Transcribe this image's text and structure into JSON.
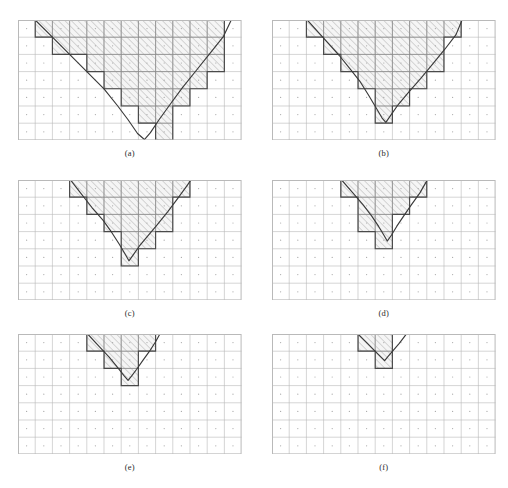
{
  "figure": {
    "caption": "",
    "panel_count": 6,
    "grid": {
      "cols": 13,
      "rows": 7,
      "cell_px": 17.2
    },
    "colors": {
      "grid_line": "#8d8d8d",
      "grid_line_light": "#b9b9b9",
      "outline": "#4a4a4a",
      "curve": "#3a3a3a",
      "hatch": "#9a9a9a",
      "hatch_fill": "#f5f5f5",
      "center_dot": "#9a9a9a",
      "background": "#ffffff"
    },
    "panels": [
      {
        "id": "a",
        "label": "(a)",
        "x": 18,
        "y": 20,
        "cols": 13,
        "rows": 7,
        "cell": 17.2,
        "level": 1,
        "staircase": [
          [
            1,
            0
          ],
          [
            1,
            1
          ],
          [
            2,
            1
          ],
          [
            2,
            2
          ],
          [
            4,
            2
          ],
          [
            4,
            3
          ],
          [
            5,
            3
          ],
          [
            5,
            4
          ],
          [
            6,
            4
          ],
          [
            6,
            5
          ],
          [
            7,
            5
          ],
          [
            7,
            6
          ],
          [
            8,
            6
          ],
          [
            8,
            7
          ],
          [
            9,
            7
          ],
          [
            9,
            5
          ],
          [
            10,
            5
          ],
          [
            10,
            4
          ],
          [
            11,
            4
          ],
          [
            11,
            3
          ],
          [
            12,
            3
          ],
          [
            12,
            0
          ]
        ],
        "curve": [
          [
            1.0,
            0.0
          ],
          [
            2.0,
            1.0
          ],
          [
            3.0,
            2.0
          ],
          [
            4.0,
            3.0
          ],
          [
            5.0,
            4.0
          ],
          [
            5.8,
            5.0
          ],
          [
            6.4,
            5.8
          ],
          [
            6.95,
            6.6
          ],
          [
            7.35,
            6.95
          ],
          [
            7.7,
            6.55
          ],
          [
            8.2,
            5.8
          ],
          [
            8.85,
            4.9
          ],
          [
            9.55,
            3.95
          ],
          [
            10.35,
            2.95
          ],
          [
            11.15,
            1.95
          ],
          [
            11.95,
            0.95
          ],
          [
            12.4,
            0.0
          ]
        ]
      },
      {
        "id": "b",
        "label": "(b)",
        "x": 272,
        "y": 20,
        "cols": 13,
        "rows": 7,
        "cell": 17.2,
        "level": 2,
        "staircase": [
          [
            2,
            0
          ],
          [
            2,
            1
          ],
          [
            3,
            1
          ],
          [
            3,
            2
          ],
          [
            4,
            2
          ],
          [
            4,
            3
          ],
          [
            5,
            3
          ],
          [
            5,
            4
          ],
          [
            6,
            4
          ],
          [
            6,
            5
          ],
          [
            6,
            6
          ],
          [
            7,
            6
          ],
          [
            7,
            5
          ],
          [
            8,
            5
          ],
          [
            8,
            4
          ],
          [
            9,
            4
          ],
          [
            9,
            3
          ],
          [
            10,
            3
          ],
          [
            10,
            2
          ],
          [
            10,
            1
          ],
          [
            11,
            1
          ],
          [
            11,
            0
          ]
        ],
        "curve": [
          [
            2.05,
            0.0
          ],
          [
            3.0,
            1.05
          ],
          [
            3.9,
            2.05
          ],
          [
            4.55,
            2.85
          ],
          [
            5.1,
            3.55
          ],
          [
            5.6,
            4.35
          ],
          [
            6.05,
            5.1
          ],
          [
            6.4,
            5.7
          ],
          [
            6.62,
            5.95
          ],
          [
            6.9,
            5.55
          ],
          [
            7.35,
            4.9
          ],
          [
            7.95,
            4.2
          ],
          [
            8.65,
            3.4
          ],
          [
            9.35,
            2.55
          ],
          [
            10.05,
            1.7
          ],
          [
            10.7,
            0.85
          ],
          [
            11.05,
            0.0
          ]
        ]
      },
      {
        "id": "c",
        "label": "(c)",
        "x": 18,
        "y": 180,
        "cols": 13,
        "rows": 7,
        "cell": 17.2,
        "level": 3,
        "staircase": [
          [
            3,
            0
          ],
          [
            3,
            1
          ],
          [
            4,
            1
          ],
          [
            4,
            2
          ],
          [
            5,
            2
          ],
          [
            5,
            3
          ],
          [
            6,
            3
          ],
          [
            6,
            4
          ],
          [
            6,
            5
          ],
          [
            7,
            5
          ],
          [
            7,
            4
          ],
          [
            8,
            4
          ],
          [
            8,
            3
          ],
          [
            9,
            3
          ],
          [
            9,
            2
          ],
          [
            9,
            1
          ],
          [
            10,
            1
          ],
          [
            10,
            0
          ]
        ],
        "curve": [
          [
            2.9,
            -0.2
          ],
          [
            3.6,
            0.7
          ],
          [
            4.3,
            1.6
          ],
          [
            4.95,
            2.35
          ],
          [
            5.45,
            3.05
          ],
          [
            5.9,
            3.75
          ],
          [
            6.25,
            4.35
          ],
          [
            6.45,
            4.7
          ],
          [
            6.7,
            4.35
          ],
          [
            7.05,
            3.85
          ],
          [
            7.55,
            3.25
          ],
          [
            8.1,
            2.6
          ],
          [
            8.7,
            1.85
          ],
          [
            9.3,
            1.05
          ],
          [
            9.85,
            0.3
          ],
          [
            10.15,
            -0.15
          ]
        ]
      },
      {
        "id": "d",
        "label": "(d)",
        "x": 272,
        "y": 180,
        "cols": 13,
        "rows": 7,
        "cell": 17.2,
        "level": 4,
        "staircase": [
          [
            4,
            0
          ],
          [
            4,
            1
          ],
          [
            5,
            1
          ],
          [
            5,
            2
          ],
          [
            5,
            3
          ],
          [
            6,
            3
          ],
          [
            6,
            4
          ],
          [
            7,
            4
          ],
          [
            7,
            3
          ],
          [
            7,
            2
          ],
          [
            8,
            2
          ],
          [
            8,
            1
          ],
          [
            9,
            1
          ],
          [
            9,
            0
          ]
        ],
        "curve": [
          [
            4.05,
            0.0
          ],
          [
            4.7,
            0.75
          ],
          [
            5.3,
            1.45
          ],
          [
            5.8,
            2.1
          ],
          [
            6.2,
            2.7
          ],
          [
            6.5,
            3.2
          ],
          [
            6.7,
            3.55
          ],
          [
            6.95,
            3.2
          ],
          [
            7.25,
            2.7
          ],
          [
            7.65,
            2.1
          ],
          [
            8.1,
            1.45
          ],
          [
            8.6,
            0.75
          ],
          [
            9.0,
            0.05
          ]
        ]
      },
      {
        "id": "e",
        "label": "(e)",
        "x": 18,
        "y": 334,
        "cols": 13,
        "rows": 7,
        "cell": 17.2,
        "level": 5,
        "staircase": [
          [
            4,
            0
          ],
          [
            4,
            1
          ],
          [
            5,
            1
          ],
          [
            5,
            2
          ],
          [
            6,
            2
          ],
          [
            6,
            3
          ],
          [
            7,
            3
          ],
          [
            7,
            1
          ],
          [
            8,
            1
          ],
          [
            8,
            0
          ]
        ],
        "curve": [
          [
            4.05,
            0.0
          ],
          [
            4.7,
            0.7
          ],
          [
            5.3,
            1.35
          ],
          [
            5.8,
            1.95
          ],
          [
            6.15,
            2.4
          ],
          [
            6.4,
            2.7
          ],
          [
            6.6,
            2.45
          ],
          [
            6.9,
            2.05
          ],
          [
            7.25,
            1.55
          ],
          [
            7.65,
            1.0
          ],
          [
            8.0,
            0.45
          ],
          [
            8.25,
            0.0
          ]
        ]
      },
      {
        "id": "f",
        "label": "(f)",
        "x": 272,
        "y": 334,
        "cols": 13,
        "rows": 7,
        "cell": 17.2,
        "level": 6,
        "staircase": [
          [
            5,
            0
          ],
          [
            5,
            1
          ],
          [
            6,
            1
          ],
          [
            6,
            2
          ],
          [
            7,
            2
          ],
          [
            7,
            1
          ],
          [
            7,
            0
          ]
        ],
        "curve": [
          [
            5.0,
            0.0
          ],
          [
            5.55,
            0.55
          ],
          [
            6.05,
            1.05
          ],
          [
            6.4,
            1.4
          ],
          [
            6.55,
            1.55
          ],
          [
            6.75,
            1.3
          ],
          [
            7.05,
            0.95
          ],
          [
            7.4,
            0.55
          ],
          [
            7.7,
            0.15
          ],
          [
            7.85,
            -0.05
          ]
        ]
      }
    ]
  }
}
